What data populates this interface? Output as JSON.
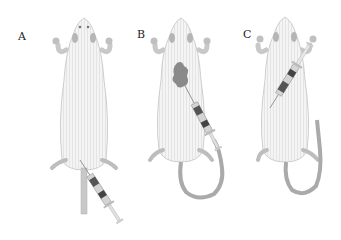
{
  "figure": {
    "panels": [
      {
        "label": "A",
        "description": "mouse with syringe injecting into tail vein"
      },
      {
        "label": "B",
        "description": "mouse with syringe injection into abdomen, dark injected region"
      },
      {
        "label": "C",
        "description": "mouse with syringe inserted diagonally from head side into abdomen"
      }
    ],
    "colors": {
      "body_fill": "#f2f2f2",
      "body_stroke": "#bdbdbd",
      "stripe": "#e2e2e2",
      "tail": "#a9a9a9",
      "syringe_dark": "#555555",
      "syringe_body": "#cfcfcf",
      "injected_area": "#8a8a8a",
      "paw": "#b5b5b5"
    }
  }
}
